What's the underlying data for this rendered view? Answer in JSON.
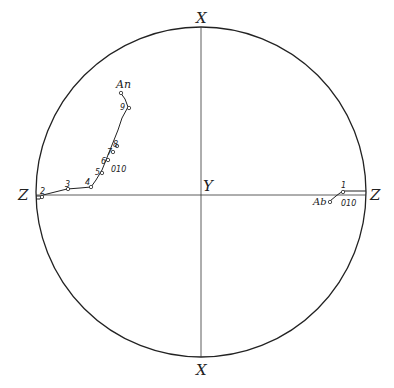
{
  "diagram": {
    "type": "stereographic-projection",
    "axes": {
      "top_label": "X",
      "bottom_label": "X",
      "left_label": "Z",
      "right_label": "Z",
      "center_label": "Y"
    },
    "path_left": {
      "label": "An",
      "plane_label": "010",
      "points": [
        "2",
        "3",
        "4",
        "5",
        "6",
        "7",
        "8",
        "9"
      ]
    },
    "path_right": {
      "label": "Ab",
      "plane_label": "010",
      "points": [
        "1"
      ]
    },
    "colors": {
      "line": "#222222",
      "background": "#ffffff"
    }
  }
}
